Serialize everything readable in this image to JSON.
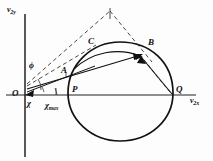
{
  "figure": {
    "type": "vector-diagram",
    "background_color": "#fdfdfd",
    "stroke_color": "#111111",
    "axes": {
      "x_axis_label": "v",
      "x_axis_sub": "2x",
      "y_axis_label": "v",
      "y_axis_sub": "2y",
      "x_axis_y_px": 95,
      "y_axis_x_px": 25
    },
    "points": [
      {
        "name": "O",
        "label": "O",
        "x": 25,
        "y": 95,
        "label_x": 14,
        "label_y": 90
      },
      {
        "name": "P",
        "label": "P",
        "x": 74,
        "y": 94,
        "label_x": 72,
        "label_y": 84
      },
      {
        "name": "Q",
        "label": "Q",
        "x": 172,
        "y": 94,
        "label_x": 174,
        "label_y": 84
      },
      {
        "name": "A",
        "label": "A",
        "x": 67,
        "y": 74,
        "label_x": 62,
        "label_y": 67
      },
      {
        "name": "B",
        "label": "B",
        "x": 143,
        "y": 52,
        "label_x": 147,
        "label_y": 41
      },
      {
        "name": "C",
        "label": "C",
        "x": 96,
        "y": 45,
        "label_x": 88,
        "label_y": 38
      }
    ],
    "angles": [
      {
        "name": "phi",
        "label": "ϕ",
        "x": 31,
        "y": 63
      },
      {
        "name": "chi",
        "label": "χ",
        "x": 28,
        "y": 99
      },
      {
        "name": "chi-max",
        "label": "χ",
        "sub": "max",
        "x": 46,
        "y": 102
      }
    ],
    "curve": {
      "shape": "egg-oval",
      "left_x": 68,
      "right_x": 173,
      "top_y": 42,
      "bottom_y": 141,
      "center_y": 93
    },
    "dashed_apex": {
      "x": 110,
      "y": 11
    }
  }
}
